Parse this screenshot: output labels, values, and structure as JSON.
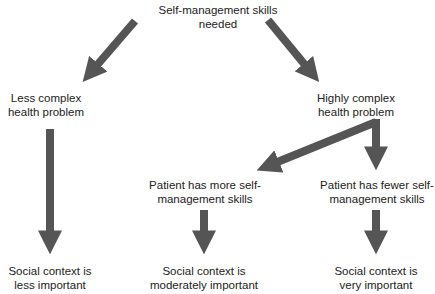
{
  "diagram": {
    "root": {
      "line1": "Self-management skills",
      "line2": "needed"
    },
    "left_branch": {
      "line1": "Less complex",
      "line2": "health problem"
    },
    "right_branch": {
      "line1": "Highly complex",
      "line2": "health problem"
    },
    "more_skills": {
      "line1": "Patient has more self-",
      "line2": "management skills"
    },
    "fewer_skills": {
      "line1": "Patient has fewer self-",
      "line2": "management skills"
    },
    "outcome_less": {
      "line1": "Social context is",
      "line2": "less important"
    },
    "outcome_moderate": {
      "line1": "Social context is",
      "line2": "moderately important"
    },
    "outcome_very": {
      "line1": "Social context is",
      "line2": "very important"
    }
  },
  "colors": {
    "arrow": "#555555",
    "text": "#222222",
    "background": "#ffffff"
  }
}
